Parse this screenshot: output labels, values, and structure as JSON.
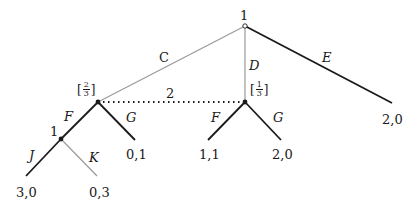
{
  "diagram": {
    "type": "extensive-form game tree",
    "nodes": {
      "root": {
        "player": "1"
      },
      "info_set": {
        "player": "2",
        "label": "2"
      },
      "left_node": {
        "belief_num": "2",
        "belief_den": "3"
      },
      "right_node": {
        "belief_num": "1",
        "belief_den": "3"
      },
      "sub_node": {
        "player": "1"
      }
    },
    "actions": {
      "C": "C",
      "D": "D",
      "E": "E",
      "F_left": "F",
      "G_left": "G",
      "F_right": "F",
      "G_right": "G",
      "J": "J",
      "K": "K"
    },
    "payoffs": {
      "E": "2,0",
      "left_G": "0,1",
      "right_F": "1,1",
      "right_G": "2,0",
      "J": "3,0",
      "K": "0,3"
    },
    "colors": {
      "solid_edge": "#1a1a1a",
      "gray_edge": "#9a9a9a"
    }
  }
}
